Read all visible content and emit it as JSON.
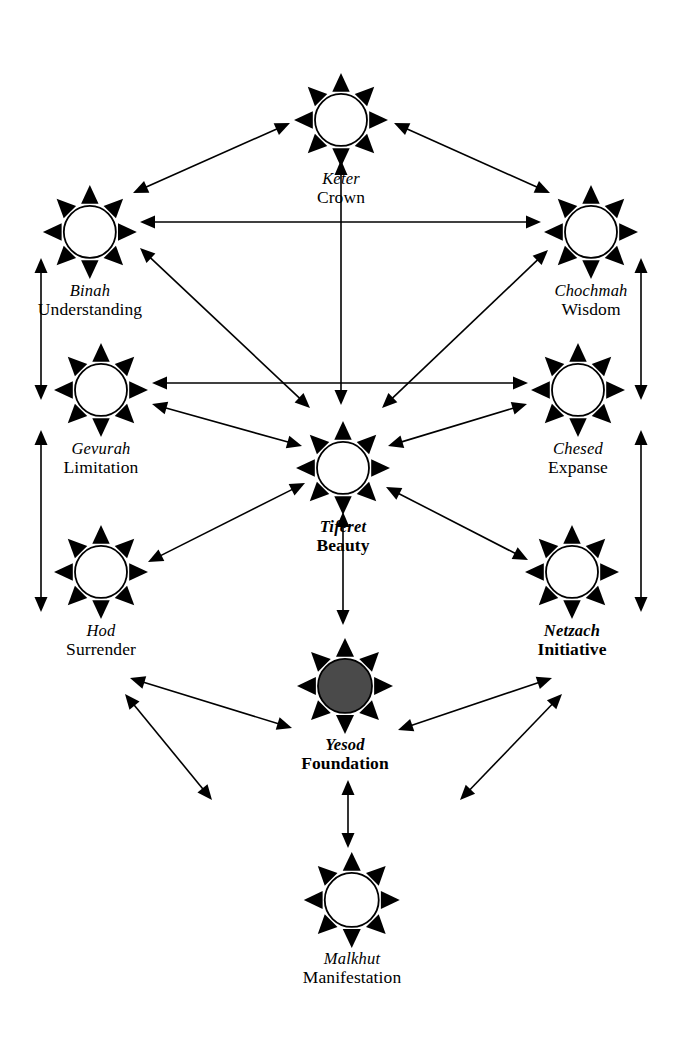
{
  "diagram": {
    "background_color": "#ffffff",
    "ink_color": "#000000",
    "filled_node_color": "#4a4a4a",
    "canvas": {
      "width": 680,
      "height": 1058
    }
  },
  "nodes": [
    {
      "id": "keter",
      "hebrew": "Keter",
      "english": "Crown",
      "cx": 341,
      "cy": 110,
      "radius": 26,
      "filled": false,
      "emphasis": false
    },
    {
      "id": "binah",
      "hebrew": "Binah",
      "english": "Understanding",
      "cx": 90,
      "cy": 222,
      "radius": 26,
      "filled": false,
      "emphasis": false
    },
    {
      "id": "chochmah",
      "hebrew": "Chochmah",
      "english": "Wisdom",
      "cx": 591,
      "cy": 222,
      "radius": 26,
      "filled": false,
      "emphasis": false
    },
    {
      "id": "gevurah",
      "hebrew": "Gevurah",
      "english": "Limitation",
      "cx": 101,
      "cy": 380,
      "radius": 26,
      "filled": false,
      "emphasis": false
    },
    {
      "id": "chesed",
      "hebrew": "Chesed",
      "english": "Expanse",
      "cx": 578,
      "cy": 380,
      "radius": 26,
      "filled": false,
      "emphasis": false
    },
    {
      "id": "tiferet",
      "hebrew": "Tiferet",
      "english": "Beauty",
      "cx": 343,
      "cy": 458,
      "radius": 26,
      "filled": false,
      "emphasis": true
    },
    {
      "id": "hod",
      "hebrew": "Hod",
      "english": "Surrender",
      "cx": 101,
      "cy": 562,
      "radius": 26,
      "filled": false,
      "emphasis": false
    },
    {
      "id": "netzach",
      "hebrew": "Netzach",
      "english": "Initiative",
      "cx": 572,
      "cy": 562,
      "radius": 26,
      "filled": false,
      "emphasis": true
    },
    {
      "id": "yesod",
      "hebrew": "Yesod",
      "english": "Foundation",
      "cx": 345,
      "cy": 676,
      "radius": 27,
      "filled": true,
      "emphasis": true
    },
    {
      "id": "malkhut",
      "hebrew": "Malkhut",
      "english": "Manifestation",
      "cx": 352,
      "cy": 890,
      "radius": 27,
      "filled": false,
      "emphasis": false
    }
  ],
  "edges": [
    {
      "id": "binah-keter",
      "from": "binah",
      "to": "keter",
      "x1": 133,
      "y1": 193,
      "x2": 290,
      "y2": 123,
      "double": true
    },
    {
      "id": "keter-chochmah",
      "from": "keter",
      "to": "chochmah",
      "x1": 394,
      "y1": 123,
      "x2": 550,
      "y2": 193,
      "double": true
    },
    {
      "id": "binah-chochmah",
      "from": "binah",
      "to": "chochmah",
      "x1": 140,
      "y1": 222,
      "x2": 541,
      "y2": 222,
      "double": true
    },
    {
      "id": "keter-tiferet",
      "from": "keter",
      "to": "tiferet",
      "x1": 341,
      "y1": 160,
      "x2": 341,
      "y2": 405,
      "double": true
    },
    {
      "id": "binah-tiferet",
      "from": "binah",
      "to": "tiferet",
      "x1": 140,
      "y1": 248,
      "x2": 310,
      "y2": 408,
      "double": true
    },
    {
      "id": "chochmah-tiferet",
      "from": "chochmah",
      "to": "tiferet",
      "x1": 548,
      "y1": 250,
      "x2": 382,
      "y2": 408,
      "double": true
    },
    {
      "id": "binah-gevurah",
      "from": "binah",
      "to": "gevurah",
      "x1": 41,
      "y1": 258,
      "x2": 41,
      "y2": 400,
      "double": true
    },
    {
      "id": "chochmah-chesed",
      "from": "chochmah",
      "to": "chesed",
      "x1": 641,
      "y1": 258,
      "x2": 641,
      "y2": 400,
      "double": true
    },
    {
      "id": "gevurah-chesed",
      "from": "gevurah",
      "to": "chesed",
      "x1": 152,
      "y1": 383,
      "x2": 528,
      "y2": 383,
      "double": true
    },
    {
      "id": "gevurah-tiferet",
      "from": "gevurah",
      "to": "tiferet",
      "x1": 152,
      "y1": 404,
      "x2": 302,
      "y2": 446,
      "double": true
    },
    {
      "id": "chesed-tiferet",
      "from": "chesed",
      "to": "tiferet",
      "x1": 527,
      "y1": 404,
      "x2": 388,
      "y2": 446,
      "double": true
    },
    {
      "id": "gevurah-hod",
      "from": "gevurah",
      "to": "hod",
      "x1": 41,
      "y1": 430,
      "x2": 41,
      "y2": 612,
      "double": true
    },
    {
      "id": "chesed-netzach",
      "from": "chesed",
      "to": "netzach",
      "x1": 641,
      "y1": 430,
      "x2": 641,
      "y2": 612,
      "double": true
    },
    {
      "id": "hod-tiferet",
      "from": "hod",
      "to": "tiferet",
      "x1": 148,
      "y1": 562,
      "x2": 305,
      "y2": 483,
      "double": true
    },
    {
      "id": "netzach-tiferet",
      "from": "netzach",
      "to": "tiferet",
      "x1": 528,
      "y1": 560,
      "x2": 386,
      "y2": 487,
      "double": true
    },
    {
      "id": "tiferet-yesod",
      "from": "tiferet",
      "to": "yesod",
      "x1": 343,
      "y1": 512,
      "x2": 343,
      "y2": 625,
      "double": true
    },
    {
      "id": "hod-yesod",
      "from": "hod",
      "to": "yesod",
      "x1": 130,
      "y1": 678,
      "x2": 292,
      "y2": 728,
      "double": true
    },
    {
      "id": "netzach-yesod",
      "from": "netzach",
      "to": "yesod",
      "x1": 552,
      "y1": 678,
      "x2": 398,
      "y2": 730,
      "double": true
    },
    {
      "id": "hod-malkhut",
      "from": "hod",
      "to": "malkhut",
      "x1": 125,
      "y1": 694,
      "x2": 212,
      "y2": 800,
      "double": true
    },
    {
      "id": "netzach-malkhut",
      "from": "netzach",
      "to": "malkhut",
      "x1": 562,
      "y1": 694,
      "x2": 460,
      "y2": 800,
      "double": true
    },
    {
      "id": "yesod-malkhut",
      "from": "yesod",
      "to": "malkhut",
      "x1": 348,
      "y1": 780,
      "x2": 348,
      "y2": 848,
      "double": true
    }
  ]
}
